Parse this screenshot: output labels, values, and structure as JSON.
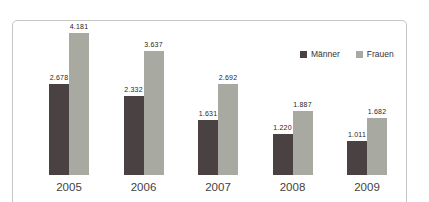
{
  "chart_data": {
    "type": "bar",
    "title": "",
    "xlabel": "",
    "ylabel": "",
    "categories": [
      "2005",
      "2006",
      "2007",
      "2008",
      "2009"
    ],
    "series": [
      {
        "name": "Männer",
        "color": "#4a4143",
        "values": [
          2678,
          2332,
          1631,
          1220,
          1011
        ],
        "labels": [
          "2.678",
          "2.332",
          "1.631",
          "1.220",
          "1.011"
        ]
      },
      {
        "name": "Frauen",
        "color": "#a8aaa1",
        "values": [
          4181,
          3637,
          2692,
          1887,
          1682
        ],
        "labels": [
          "4.181",
          "3.637",
          "2.692",
          "1.887",
          "1.682"
        ]
      }
    ],
    "ylim": [
      0,
      4400
    ],
    "grid": false,
    "axes_visible": false,
    "legend_position": "top-right",
    "frame_border_color": "#c6c6c6",
    "value_label_color": "#262626",
    "axis_label_color": "#3f3f3f"
  }
}
